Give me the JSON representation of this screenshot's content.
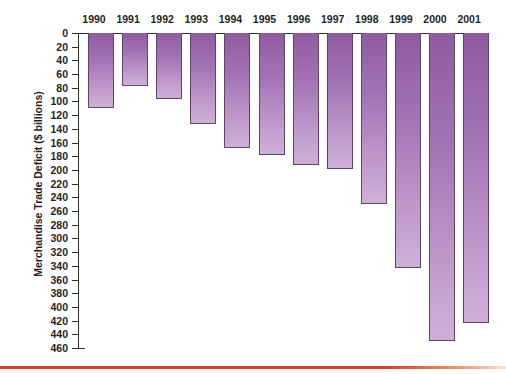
{
  "chart_data": {
    "type": "bar",
    "title": "",
    "subtitle": "",
    "xlabel": "",
    "ylabel": "Merchandise Trade Deficit ($ billions)",
    "categories": [
      "1990",
      "1991",
      "1992",
      "1993",
      "1994",
      "1995",
      "1996",
      "1997",
      "1998",
      "1999",
      "2000",
      "2001"
    ],
    "values": [
      109,
      77,
      97,
      133,
      168,
      178,
      193,
      198,
      249,
      343,
      450,
      423
    ],
    "ylim": [
      0,
      460
    ],
    "y_ticks": [
      0,
      20,
      40,
      60,
      80,
      100,
      120,
      140,
      160,
      180,
      200,
      220,
      240,
      260,
      280,
      300,
      320,
      340,
      360,
      380,
      400,
      420,
      440,
      460
    ],
    "y_tick_labels": [
      "0",
      "20",
      "40",
      "60",
      "80",
      "100",
      "120",
      "140",
      "160",
      "180",
      "200",
      "220",
      "240",
      "260",
      "280",
      "300",
      "320",
      "340",
      "360",
      "380",
      "400",
      "420",
      "440",
      "460"
    ],
    "y_axis_inverted": true,
    "x_axis_position": "top",
    "grid": false,
    "legend": null,
    "legend_position": "none",
    "bar_color_top": "#8f5ca0",
    "bar_color_bottom": "#cfb0d8",
    "bar_border_color": "#5d4564",
    "axis_color": "#2b2b2b",
    "background_color": "#ffffff",
    "accent_rule_color": "#d2402b",
    "note": "Bars extend downward from the zero line at the top; larger values mean larger deficits."
  },
  "figure": {
    "name": "merchandise-trade-deficit-bar-chart"
  }
}
